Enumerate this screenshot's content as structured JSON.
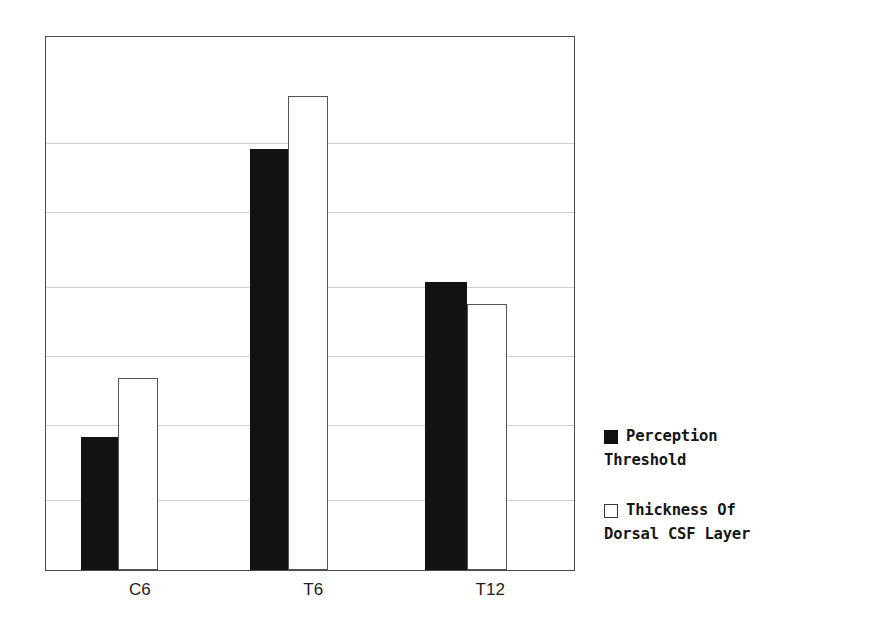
{
  "chart_data": {
    "type": "bar",
    "title": "",
    "subtitle": "",
    "xlabel": "",
    "ylabel": "",
    "categories": [
      "C6",
      "T6",
      "T12"
    ],
    "series": [
      {
        "name": "Perception Threshold",
        "marker": "filled-square",
        "color": "#121212",
        "values": [
          25,
          79,
          54
        ]
      },
      {
        "name": "Thickness Of Dorsal CSF Layer",
        "marker": "hollow-square",
        "color": "#ffffff",
        "values": [
          36,
          89,
          50
        ]
      }
    ],
    "ylim": [
      0,
      100
    ],
    "grid": true,
    "grid_values": [
      13,
      27,
      40,
      53,
      67,
      80
    ],
    "y_axis_ticks_visible": false,
    "legend_position": "right"
  },
  "axis": {
    "tick_labels": [
      {
        "label": "C6",
        "center_pct": 17.9
      },
      {
        "label": "T6",
        "center_pct": 50.6
      },
      {
        "label": "T12",
        "center_pct": 84.0
      }
    ]
  },
  "legend": {
    "entries": [
      {
        "marker": "filled-square",
        "label": "Perception\nThreshold"
      },
      {
        "marker": "hollow-square",
        "label": "Thickness Of\nDorsal CSF Layer"
      }
    ]
  },
  "colors": {
    "series_filled": "#121212",
    "series_hollow_fill": "#ffffff",
    "series_hollow_stroke": "#555555",
    "frame": "#4a4a4a",
    "gridline": "#cfcfcf",
    "background": "#ffffff",
    "text": "#1a1a1a"
  }
}
